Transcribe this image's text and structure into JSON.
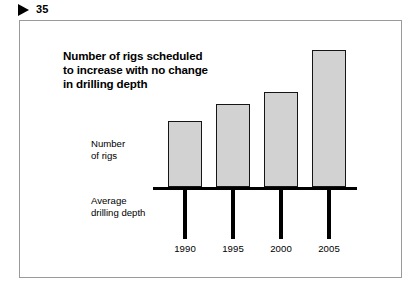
{
  "header": {
    "marker_icon": "triangle-right-icon",
    "page_number": "35"
  },
  "slide": {
    "title_lines": [
      "Number of rigs scheduled",
      "to increase with no change",
      "in drilling depth"
    ],
    "series_labels": {
      "bars_line1": "Number",
      "bars_line2": "of rigs",
      "lines_line1": "Average",
      "lines_line2": "drilling depth"
    },
    "colors": {
      "bar_fill": "#d2d2d2",
      "bar_stroke": "#151515",
      "axis": "#000000",
      "frame": "#9a9a9a",
      "background": "#ffffff"
    }
  },
  "chart_data": {
    "type": "bar",
    "title": "Number of rigs scheduled to increase with no change in drilling depth",
    "xlabel": "",
    "ylabel": "Number of rigs",
    "categories": [
      "1990",
      "1995",
      "2000",
      "2005"
    ],
    "series": [
      {
        "name": "Number of rigs",
        "type": "bar",
        "values": [
          100,
          125,
          144,
          208
        ],
        "unit": "index (1990 = 100)"
      },
      {
        "name": "Average drilling depth",
        "type": "dropline",
        "values": [
          100,
          100,
          100,
          100
        ],
        "unit": "index (1990 = 100)"
      }
    ],
    "ylim": [
      0,
      230
    ],
    "grid": false,
    "legend": "inline-left-labels",
    "annotations": [
      "Bars above the axis represent number of rigs and increase across all four periods.",
      "Equal-length drop lines below the axis represent average drilling depth, which is unchanged."
    ]
  }
}
